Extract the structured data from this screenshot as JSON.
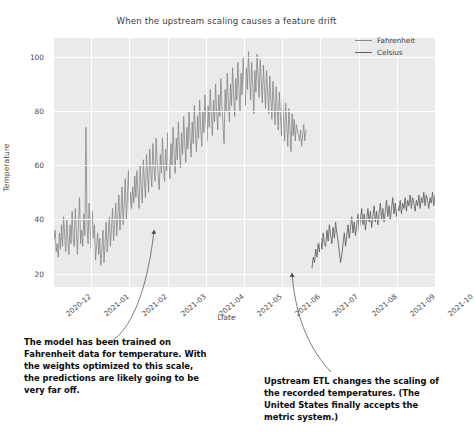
{
  "chart_data": {
    "type": "line",
    "title": "When the upstream scaling causes a feature drift",
    "xlabel": "Date",
    "ylabel": "Temperature",
    "ylim": [
      15,
      107
    ],
    "grid": true,
    "legend_position": "upper right",
    "xticks": [
      "2020-12",
      "2021-01",
      "2021-02",
      "2021-03",
      "2021-04",
      "2021-05",
      "2021-06",
      "2021-07",
      "2021-08",
      "2021-09",
      "2021-10"
    ],
    "yticks": [
      20,
      40,
      60,
      80,
      100
    ],
    "series": [
      {
        "name": "Fahrenheit",
        "color": "#7f7f7f",
        "x_start": "2020-12-01",
        "x_end": "2021-06-20",
        "values": [
          41,
          33,
          36,
          28,
          31,
          26,
          35,
          29,
          38,
          30,
          41,
          34,
          28,
          40,
          32,
          27,
          38,
          31,
          43,
          33,
          30,
          44,
          35,
          27,
          39,
          48,
          31,
          36,
          30,
          42,
          34,
          74,
          38,
          31,
          46,
          36,
          29,
          43,
          33,
          38,
          25,
          30,
          35,
          27,
          33,
          23,
          29,
          36,
          24,
          31,
          39,
          28,
          34,
          41,
          30,
          36,
          44,
          32,
          38,
          46,
          34,
          41,
          49,
          36,
          43,
          52,
          38,
          46,
          55,
          40,
          48,
          58,
          42,
          50,
          44,
          52,
          46,
          56,
          48,
          58,
          50,
          44,
          60,
          52,
          46,
          62,
          54,
          48,
          64,
          56,
          50,
          66,
          58,
          52,
          68,
          60,
          54,
          70,
          62,
          56,
          51,
          64,
          57,
          70,
          60,
          54,
          66,
          58,
          72,
          62,
          55,
          68,
          60,
          74,
          64,
          57,
          70,
          62,
          76,
          66,
          59,
          72,
          64,
          78,
          68,
          61,
          74,
          66,
          80,
          70,
          63,
          76,
          68,
          82,
          72,
          65,
          78,
          70,
          84,
          74,
          67,
          80,
          72,
          86,
          76,
          69,
          82,
          74,
          88,
          78,
          71,
          84,
          76,
          90,
          80,
          73,
          86,
          78,
          92,
          82,
          75,
          68,
          88,
          80,
          94,
          84,
          76,
          90,
          82,
          96,
          86,
          78,
          92,
          84,
          98,
          88,
          80,
          94,
          86,
          100,
          90,
          82,
          96,
          88,
          102,
          92,
          84,
          98,
          90,
          79,
          95,
          87,
          101,
          93,
          85,
          99,
          91,
          83,
          97,
          89,
          81,
          95,
          87,
          79,
          93,
          85,
          77,
          91,
          83,
          75,
          89,
          81,
          73,
          87,
          79,
          71,
          85,
          77,
          69,
          83,
          75,
          67,
          81,
          73,
          65,
          79,
          71,
          77,
          69,
          75,
          73,
          71,
          69,
          73,
          67,
          71,
          75,
          69,
          73
        ]
      },
      {
        "name": "Celsius",
        "color": "#5e5e5e",
        "x_start": "2021-06-22",
        "x_end": "2021-10-01",
        "values": [
          22,
          26,
          24,
          29,
          26,
          31,
          28,
          33,
          29,
          35,
          31,
          30,
          36,
          32,
          38,
          34,
          31,
          37,
          33,
          39,
          35,
          32,
          28,
          24,
          27,
          31,
          35,
          30,
          34,
          38,
          33,
          37,
          41,
          35,
          39,
          34,
          38,
          42,
          36,
          40,
          44,
          38,
          42,
          36,
          40,
          44,
          39,
          43,
          37,
          41,
          45,
          39,
          43,
          38,
          42,
          46,
          40,
          44,
          39,
          43,
          47,
          41,
          45,
          40,
          44,
          48,
          42,
          46,
          41,
          45,
          43,
          47,
          42,
          46,
          44,
          48,
          43,
          47,
          45,
          49,
          44,
          48,
          46,
          43,
          47,
          45,
          49,
          44,
          48,
          46,
          50,
          45,
          49,
          47,
          44,
          48,
          46,
          50,
          45,
          49
        ]
      }
    ],
    "annotations": [
      {
        "name": "fahrenheit-note",
        "text": "The model has been trained on Fahrenheit data for temperature. With the weights optimized to this scale, the predictions are likely going to be very far off.",
        "points_to": "Fahrenheit series mid-2021-02"
      },
      {
        "name": "celsius-note",
        "text": "Upstream ETL changes the scaling of the recorded temperatures. (The United States finally accepts the metric system.)",
        "points_to": "Celsius series start 2021-06"
      }
    ]
  }
}
